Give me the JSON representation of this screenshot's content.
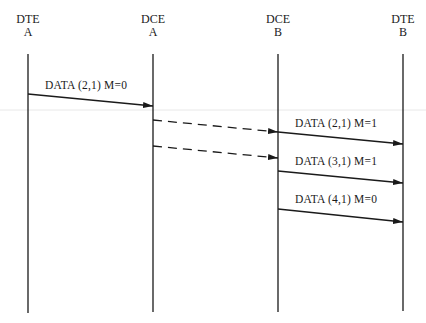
{
  "diagram": {
    "type": "sequence",
    "faint_rule_color": "#e6e6e6",
    "line_color": "#1a1a1a",
    "entities": [
      {
        "id": "dte_a",
        "line1": "DTE",
        "line2": "A",
        "x": 28
      },
      {
        "id": "dce_a",
        "line1": "DCE",
        "line2": "A",
        "x": 153
      },
      {
        "id": "dce_b",
        "line1": "DCE",
        "line2": "B",
        "x": 278
      },
      {
        "id": "dte_b",
        "line1": "DTE",
        "line2": "B",
        "x": 403
      }
    ],
    "messages": [
      {
        "from": "dte_a",
        "to": "dce_a",
        "label": "DATA (2,1) M=0",
        "style": "solid"
      },
      {
        "from": "dce_a",
        "to": "dce_b",
        "label": "",
        "style": "dashed"
      },
      {
        "from": "dce_a",
        "to": "dce_b",
        "label": "",
        "style": "dashed"
      },
      {
        "from": "dce_b",
        "to": "dte_b",
        "label": "DATA (2,1) M=1",
        "style": "solid"
      },
      {
        "from": "dce_b",
        "to": "dte_b",
        "label": "DATA (3,1) M=1",
        "style": "solid"
      },
      {
        "from": "dce_b",
        "to": "dte_b",
        "label": "DATA (4,1) M=0",
        "style": "solid"
      }
    ]
  }
}
